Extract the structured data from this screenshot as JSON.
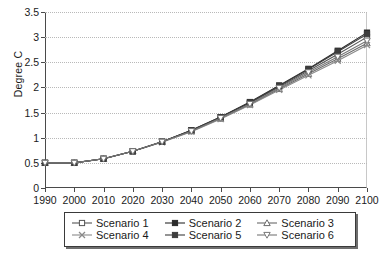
{
  "chart_data": {
    "type": "line",
    "title": "",
    "subtitle": "",
    "xlabel": "",
    "ylabel": "Degree C",
    "x": [
      1990,
      2000,
      2010,
      2020,
      2030,
      2040,
      2050,
      2060,
      2070,
      2080,
      2090,
      2100
    ],
    "xtick_labels": [
      "1990",
      "2000",
      "2010",
      "2020",
      "2030",
      "2040",
      "2050",
      "2060",
      "2070",
      "2080",
      "2090",
      "2100"
    ],
    "ytick_labels": [
      "0",
      "0.5",
      "1",
      "1.5",
      "2",
      "2.5",
      "3",
      "3.5"
    ],
    "ytick_values": [
      0,
      0.5,
      1,
      1.5,
      2,
      2.5,
      3,
      3.5
    ],
    "xlim": [
      1990,
      2100
    ],
    "ylim": [
      0,
      3.5
    ],
    "grid": "horizontal-dotted",
    "legend_position": "bottom",
    "legend_columns": 3,
    "series": [
      {
        "name": "Scenario 1",
        "marker": "open-square",
        "color": "#555555",
        "values": [
          0.5,
          0.5,
          0.58,
          0.73,
          0.92,
          1.14,
          1.4,
          1.69,
          2.01,
          2.33,
          2.66,
          3.0
        ]
      },
      {
        "name": "Scenario 2",
        "marker": "filled-square",
        "color": "#2b2b2b",
        "values": [
          0.5,
          0.5,
          0.58,
          0.73,
          0.92,
          1.15,
          1.41,
          1.71,
          2.04,
          2.37,
          2.73,
          3.09
        ]
      },
      {
        "name": "Scenario 3",
        "marker": "up-triangle",
        "color": "#6b6b6b",
        "values": [
          0.5,
          0.5,
          0.58,
          0.73,
          0.92,
          1.13,
          1.38,
          1.66,
          1.97,
          2.27,
          2.57,
          2.88
        ]
      },
      {
        "name": "Scenario 4",
        "marker": "cross",
        "color": "#8a8a8a",
        "values": [
          0.5,
          0.5,
          0.58,
          0.73,
          0.91,
          1.12,
          1.37,
          1.65,
          1.95,
          2.24,
          2.53,
          2.84
        ]
      },
      {
        "name": "Scenario 5",
        "marker": "filled-square",
        "color": "#3d3d3d",
        "values": [
          0.5,
          0.5,
          0.58,
          0.73,
          0.92,
          1.15,
          1.41,
          1.7,
          2.03,
          2.36,
          2.71,
          3.06
        ]
      },
      {
        "name": "Scenario 6",
        "marker": "down-triangle",
        "color": "#777777",
        "values": [
          0.5,
          0.5,
          0.58,
          0.73,
          0.92,
          1.13,
          1.39,
          1.67,
          1.99,
          2.3,
          2.61,
          2.93
        ]
      }
    ]
  }
}
